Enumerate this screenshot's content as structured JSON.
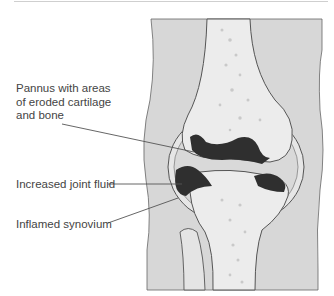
{
  "diagram": {
    "labels": [
      {
        "id": "pannus",
        "text": "Pannus with areas of eroded cartilage and bone"
      },
      {
        "id": "fluid",
        "text": "Increased joint fluid"
      },
      {
        "id": "synovium",
        "text": "Inflamed synovium"
      }
    ],
    "colors": {
      "soft_tissue": "#d7d7d7",
      "bone": "#ececec",
      "bone_spots": "#c9c9c9",
      "pannus": "#2f2f2f",
      "fluid": "#dcdcdc",
      "outline": "#555555",
      "leader_line": "#555555"
    }
  }
}
